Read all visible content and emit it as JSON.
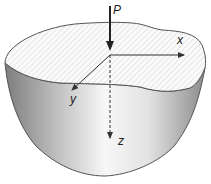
{
  "diagram": {
    "title": "",
    "labels": {
      "load": "P",
      "x_axis": "x",
      "y_axis": "y",
      "z_axis": "z"
    },
    "colors": {
      "outline": "#555555",
      "surface_hatch": "#c8c8c8",
      "body_dark": "#8a8a8a",
      "body_light": "#ffffff",
      "arrow": "#333333"
    }
  }
}
